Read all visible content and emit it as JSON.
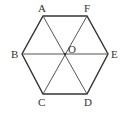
{
  "figure": {
    "type": "regular-hexagon",
    "stroke_color": "#333333",
    "diagonal_color": "#555555",
    "vertices": {
      "A": [
        43,
        16
      ],
      "F": [
        87,
        16
      ],
      "E": [
        108,
        54
      ],
      "D": [
        87,
        94
      ],
      "C": [
        43,
        94
      ],
      "B": [
        22,
        54
      ]
    },
    "center": {
      "O": [
        65,
        54
      ]
    },
    "labels": {
      "A": "A",
      "B": "B",
      "C": "C",
      "D": "D",
      "E": "E",
      "F": "F",
      "O": "O"
    },
    "diagonals": [
      "AD",
      "BE",
      "CF"
    ]
  }
}
